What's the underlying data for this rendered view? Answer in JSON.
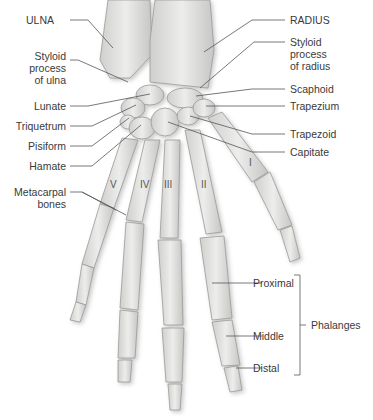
{
  "diagram": {
    "left_labels": [
      {
        "id": "ulna",
        "text": "ULNA"
      },
      {
        "id": "styloid-ulna",
        "lines": [
          "Styloid",
          "process",
          "of ulna"
        ]
      },
      {
        "id": "lunate",
        "text": "Lunate"
      },
      {
        "id": "triquetrum",
        "text": "Triquetrum"
      },
      {
        "id": "pisiform",
        "text": "Pisiform"
      },
      {
        "id": "hamate",
        "text": "Hamate"
      },
      {
        "id": "metacarpal",
        "lines": [
          "Metacarpal",
          "bones"
        ]
      }
    ],
    "right_labels": [
      {
        "id": "radius",
        "text": "RADIUS"
      },
      {
        "id": "styloid-radius",
        "lines": [
          "Styloid",
          "process",
          "of radius"
        ]
      },
      {
        "id": "scaphoid",
        "text": "Scaphoid"
      },
      {
        "id": "trapezium",
        "text": "Trapezium"
      },
      {
        "id": "trapezoid",
        "text": "Trapezoid"
      },
      {
        "id": "capitate",
        "text": "Capitate"
      }
    ],
    "phalanges": {
      "group_label": "Phalanges",
      "items": [
        "Proximal",
        "Middle",
        "Distal"
      ]
    },
    "metacarpal_numerals": [
      "V",
      "IV",
      "III",
      "II",
      "I"
    ],
    "colors": {
      "bone": "#e6e6e4",
      "bone_shadow": "#b5b5b3",
      "text": "#3a3a3a",
      "leader": "#555555"
    }
  }
}
